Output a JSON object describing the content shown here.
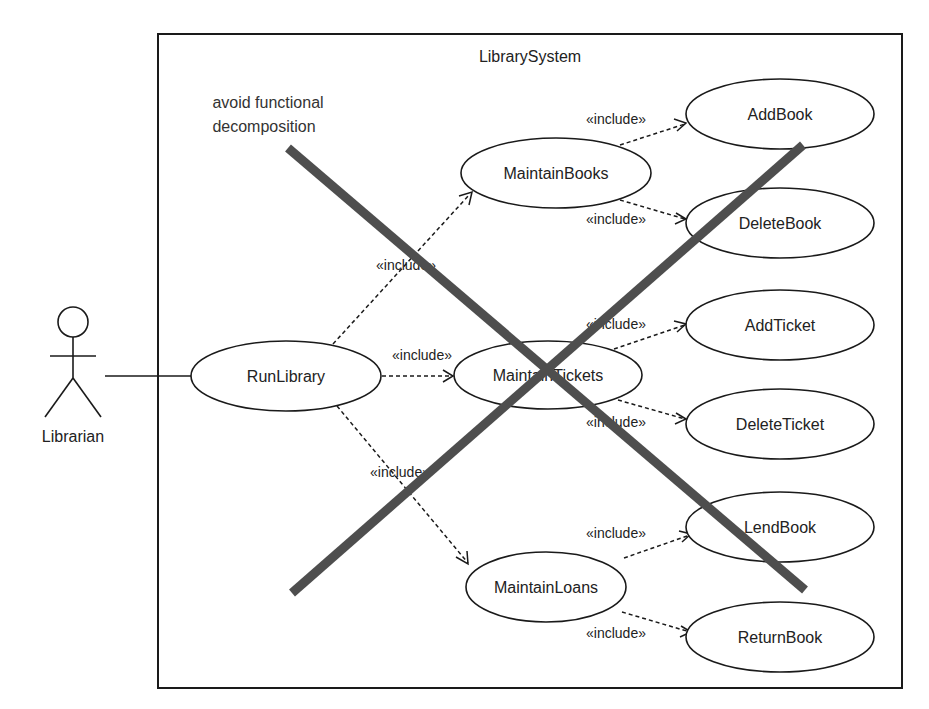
{
  "system": {
    "title": "LibrarySystem"
  },
  "note": {
    "line1": "avoid functional",
    "line2": "decomposition"
  },
  "actor": {
    "name": "Librarian"
  },
  "use_cases": {
    "run_library": "RunLibrary",
    "maintain_books": "MaintainBooks",
    "maintain_tickets": "MaintainTickets",
    "maintain_loans": "MaintainLoans",
    "add_book": "AddBook",
    "delete_book": "DeleteBook",
    "add_ticket": "AddTicket",
    "delete_ticket": "DeleteTicket",
    "lend_book": "LendBook",
    "return_book": "ReturnBook"
  },
  "relations": {
    "stereotype": "«include»",
    "list": [
      {
        "from": "RunLibrary",
        "to": "MaintainBooks",
        "label": "«include»"
      },
      {
        "from": "RunLibrary",
        "to": "MaintainTickets",
        "label": "«include»"
      },
      {
        "from": "RunLibrary",
        "to": "MaintainLoans",
        "label": "«include»"
      },
      {
        "from": "MaintainBooks",
        "to": "AddBook",
        "label": "«include»"
      },
      {
        "from": "MaintainBooks",
        "to": "DeleteBook",
        "label": "«include»"
      },
      {
        "from": "MaintainTickets",
        "to": "AddTicket",
        "label": "«include»"
      },
      {
        "from": "MaintainTickets",
        "to": "DeleteTicket",
        "label": "«include»"
      },
      {
        "from": "MaintainLoans",
        "to": "LendBook",
        "label": "«include»"
      },
      {
        "from": "MaintainLoans",
        "to": "ReturnBook",
        "label": "«include»"
      }
    ]
  },
  "colors": {
    "line": "#1a1a1a",
    "cross": "#4e4e4e",
    "background": "#ffffff"
  }
}
